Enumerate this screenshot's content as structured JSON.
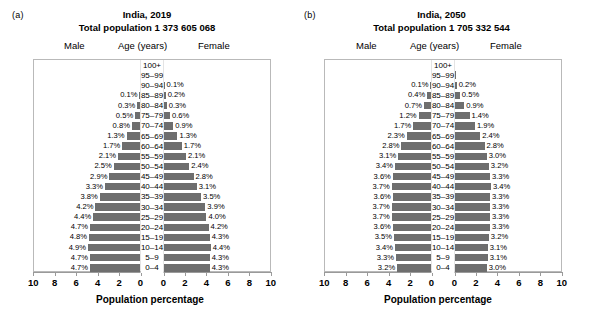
{
  "figure": {
    "panels": [
      {
        "letter": "(a)",
        "title": "India, 2019",
        "subtitle": "Total population 1 373 605 068",
        "legend": {
          "male": "Male",
          "age": "Age (years)",
          "female": "Female"
        },
        "xlabel": "Population percentage",
        "xticks": [
          "10",
          "8",
          "6",
          "4",
          "2",
          "0",
          "0",
          "2",
          "4",
          "6",
          "8",
          "10"
        ]
      },
      {
        "letter": "(b)",
        "title": "India, 2050",
        "subtitle": "Total population 1 705 332 544",
        "legend": {
          "male": "Male",
          "age": "Age (years)",
          "female": "Female"
        },
        "xlabel": "Population percentage",
        "xticks": [
          "10",
          "8",
          "6",
          "4",
          "2",
          "0",
          "0",
          "2",
          "4",
          "6",
          "8",
          "10"
        ]
      }
    ]
  },
  "chart_data": [
    {
      "type": "bar",
      "subtype": "population-pyramid",
      "panel": "(a)",
      "title": "India, 2019",
      "subtitle": "Total population 1 373 605 068",
      "xlabel": "Population percentage",
      "ylabel": "Age (years)",
      "xlim": [
        -10,
        10
      ],
      "xticks": [
        10,
        8,
        6,
        4,
        2,
        0,
        0,
        2,
        4,
        6,
        8,
        10
      ],
      "grid": false,
      "legend_position": "top",
      "bar_color": "#6e6e6e",
      "categories": [
        "100+",
        "95–99",
        "90–94",
        "85–89",
        "80–84",
        "75–79",
        "70–74",
        "65–69",
        "60–64",
        "55–59",
        "50–54",
        "45–49",
        "40–44",
        "35–39",
        "30–34",
        "25–29",
        "20–24",
        "15–19",
        "10–14",
        "5–9",
        "0–4"
      ],
      "series": [
        {
          "name": "Male",
          "values": [
            0.0,
            0.0,
            0.05,
            0.1,
            0.3,
            0.5,
            0.8,
            1.3,
            1.7,
            2.1,
            2.5,
            2.9,
            3.3,
            3.8,
            4.2,
            4.4,
            4.7,
            4.8,
            4.9,
            4.7,
            4.7
          ],
          "labels": [
            "",
            "",
            "",
            "0.1%",
            "0.3%",
            "0.5%",
            "0.8%",
            "1.3%",
            "1.7%",
            "2.1%",
            "2.5%",
            "2.9%",
            "3.3%",
            "3.8%",
            "4.2%",
            "4.4%",
            "4.7%",
            "4.8%",
            "4.9%",
            "4.7%",
            "4.7%"
          ]
        },
        {
          "name": "Female",
          "values": [
            0.0,
            0.0,
            0.1,
            0.2,
            0.3,
            0.6,
            0.9,
            1.3,
            1.7,
            2.1,
            2.4,
            2.8,
            3.1,
            3.5,
            3.9,
            4.0,
            4.2,
            4.3,
            4.4,
            4.3,
            4.3
          ],
          "labels": [
            "",
            "",
            "0.1%",
            "0.2%",
            "0.3%",
            "0.6%",
            "0.9%",
            "1.3%",
            "1.7%",
            "2.1%",
            "2.4%",
            "2.8%",
            "3.1%",
            "3.5%",
            "3.9%",
            "4.0%",
            "4.2%",
            "4.3%",
            "4.4%",
            "4.3%",
            "4.3%"
          ]
        }
      ]
    },
    {
      "type": "bar",
      "subtype": "population-pyramid",
      "panel": "(b)",
      "title": "India, 2050",
      "subtitle": "Total population 1 705 332 544",
      "xlabel": "Population percentage",
      "ylabel": "Age (years)",
      "xlim": [
        -10,
        10
      ],
      "xticks": [
        10,
        8,
        6,
        4,
        2,
        0,
        0,
        2,
        4,
        6,
        8,
        10
      ],
      "grid": false,
      "legend_position": "top",
      "bar_color": "#6e6e6e",
      "categories": [
        "100+",
        "95–99",
        "90–94",
        "85–89",
        "80–84",
        "75–79",
        "70–74",
        "65–69",
        "60–64",
        "55–59",
        "50–54",
        "45–49",
        "40–44",
        "35–39",
        "30–34",
        "25–29",
        "20–24",
        "15–19",
        "10–14",
        "5–9",
        "0–4"
      ],
      "series": [
        {
          "name": "Male",
          "values": [
            0.0,
            0.03,
            0.1,
            0.4,
            0.7,
            1.2,
            1.7,
            2.3,
            2.8,
            3.1,
            3.4,
            3.6,
            3.7,
            3.6,
            3.7,
            3.7,
            3.6,
            3.5,
            3.4,
            3.3,
            3.2
          ],
          "labels": [
            "",
            "",
            "0.1%",
            "0.4%",
            "0.7%",
            "1.2%",
            "1.7%",
            "2.3%",
            "2.8%",
            "3.1%",
            "3.4%",
            "3.6%",
            "3.7%",
            "3.6%",
            "3.7%",
            "3.7%",
            "3.6%",
            "3.5%",
            "3.4%",
            "3.3%",
            "3.2%"
          ]
        },
        {
          "name": "Female",
          "values": [
            0.0,
            0.05,
            0.2,
            0.5,
            0.9,
            1.4,
            1.9,
            2.4,
            2.8,
            3.0,
            3.2,
            3.3,
            3.4,
            3.3,
            3.3,
            3.3,
            3.3,
            3.2,
            3.1,
            3.1,
            3.0
          ],
          "labels": [
            "",
            "",
            "0.2%",
            "0.5%",
            "0.9%",
            "1.4%",
            "1.9%",
            "2.4%",
            "2.8%",
            "3.0%",
            "3.2%",
            "3.3%",
            "3.4%",
            "3.3%",
            "3.3%",
            "3.3%",
            "3.3%",
            "3.2%",
            "3.1%",
            "3.1%",
            "3.0%"
          ]
        }
      ]
    }
  ]
}
